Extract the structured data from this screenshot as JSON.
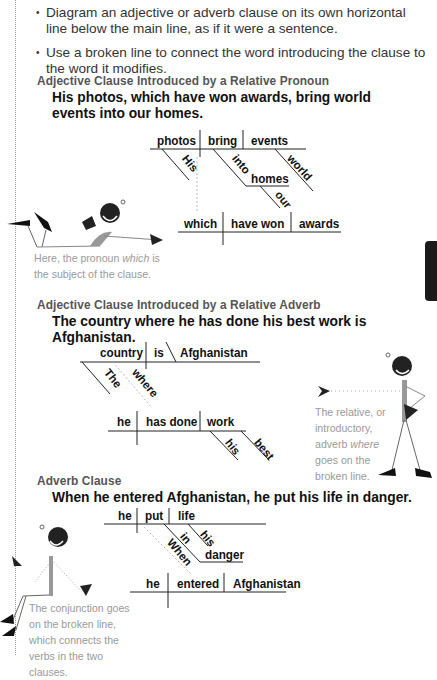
{
  "bullets": [
    "Diagram an adjective or adverb clause on its own horizontal line below the main line, as if it were a sentence.",
    "Use a broken line to connect the word introducing the clause to the word it modifies."
  ],
  "sections": [
    {
      "heading": "Adjective Clause Introduced by a Relative Pronoun",
      "sentence": "His photos, which have won awards, bring world events into our homes.",
      "diagram": {
        "main": [
          "photos",
          "bring",
          "events"
        ],
        "modifiers": [
          "His",
          "into",
          "homes",
          "our",
          "world"
        ],
        "clause": [
          "which",
          "have won",
          "awards"
        ]
      },
      "caption_parts": [
        "Here, the pronoun ",
        "which",
        " is the subject of the clause."
      ]
    },
    {
      "heading": "Adjective Clause Introduced by a Relative Adverb",
      "sentence": "The country where he has done his best work is Afghanistan.",
      "diagram": {
        "main": [
          "country",
          "is",
          "Afghanistan"
        ],
        "modifiers": [
          "The",
          "where",
          "his",
          "best"
        ],
        "clause": [
          "he",
          "has done",
          "work"
        ]
      },
      "caption_parts": [
        "The relative, or introductory, adverb ",
        "where",
        " goes on the broken line."
      ]
    },
    {
      "heading": "Adverb Clause",
      "sentence": "When he entered Afghanistan, he put his life in danger.",
      "diagram": {
        "main": [
          "he",
          "put",
          "life"
        ],
        "modifiers": [
          "his",
          "in",
          "danger",
          "When"
        ],
        "clause": [
          "he",
          "entered",
          "Afghanistan"
        ]
      },
      "caption": "The conjunction goes on the broken line, which connects the verbs in the two clauses."
    }
  ],
  "colors": {
    "text": "#111111",
    "heading": "#555555",
    "caption": "#9a9a9a",
    "tab": "#1a1a1a",
    "figure_gray": "#999999"
  }
}
